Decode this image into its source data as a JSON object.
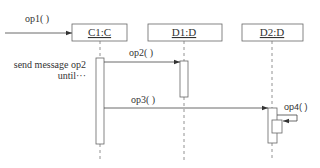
{
  "diagram": {
    "type": "UML sequence diagram",
    "objects": [
      {
        "id": "c1",
        "label": "C1:C"
      },
      {
        "id": "d1",
        "label": "D1:D"
      },
      {
        "id": "d2",
        "label": "D2:D"
      }
    ],
    "messages": [
      {
        "id": "op1",
        "label": "op1( )",
        "from": "external",
        "to": "c1"
      },
      {
        "id": "op2",
        "label": "op2( )",
        "from": "c1",
        "to": "d1"
      },
      {
        "id": "op3",
        "label": "op3( )",
        "from": "c1",
        "to": "d2"
      },
      {
        "id": "op4",
        "label": "op4( )",
        "from": "d2",
        "to": "d2"
      }
    ],
    "annotation": {
      "line1": "send message op2",
      "line2": "until···"
    },
    "colors": {
      "line": "#555555",
      "text": "#333333",
      "background": "#ffffff"
    }
  }
}
